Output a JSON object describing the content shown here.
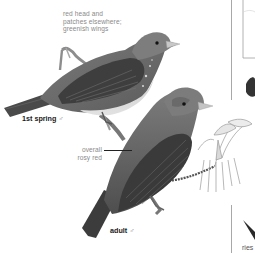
{
  "illustration": {
    "subject": "Scarlet Tanager",
    "birds": [
      {
        "id": "first-spring-male",
        "caption": "1st spring",
        "sex_symbol": "♂",
        "annotation": {
          "lines": [
            "red head and",
            "patches elsewhere;",
            "greenish wings"
          ]
        }
      },
      {
        "id": "adult-male",
        "caption": "adult",
        "sex_symbol": "♂",
        "annotation": {
          "lines": [
            "overall",
            "rosy red"
          ]
        }
      }
    ],
    "right_panel": {
      "cut_text": "ries"
    }
  },
  "colors": {
    "background": "#ffffff",
    "annotation_text": "#8a8a8a",
    "caption_text": "#1a1a1a",
    "bird_dark": "#3a3a3a",
    "bird_mid": "#6f6f6f",
    "bird_light": "#bdbdbd",
    "divider": "#a8a8a8"
  }
}
